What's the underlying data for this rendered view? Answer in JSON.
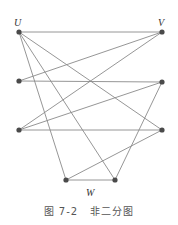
{
  "figure": {
    "labels": {
      "top_left": "U",
      "top_right": "V",
      "bottom": "W"
    },
    "caption": {
      "number": "图 7-2",
      "title": "非二分图"
    },
    "colors": {
      "edge": "#8a8a8a",
      "node": "#4a4a4a"
    },
    "nodes": [
      {
        "id": "U",
        "x": 19,
        "y": 32
      },
      {
        "id": "V",
        "x": 162,
        "y": 32
      },
      {
        "id": "L2",
        "x": 19,
        "y": 81
      },
      {
        "id": "R2",
        "x": 162,
        "y": 82
      },
      {
        "id": "L3",
        "x": 19,
        "y": 130
      },
      {
        "id": "R3",
        "x": 162,
        "y": 130
      },
      {
        "id": "B1",
        "x": 66,
        "y": 180
      },
      {
        "id": "B2",
        "x": 115,
        "y": 180
      }
    ],
    "edges": [
      [
        "U",
        "V"
      ],
      [
        "U",
        "R3"
      ],
      [
        "U",
        "B1"
      ],
      [
        "U",
        "B2"
      ],
      [
        "L2",
        "V"
      ],
      [
        "L2",
        "R2"
      ],
      [
        "L3",
        "V"
      ],
      [
        "L3",
        "R2"
      ],
      [
        "L3",
        "R3"
      ],
      [
        "R2",
        "B2"
      ],
      [
        "R3",
        "B1"
      ],
      [
        "B1",
        "B2"
      ]
    ]
  }
}
